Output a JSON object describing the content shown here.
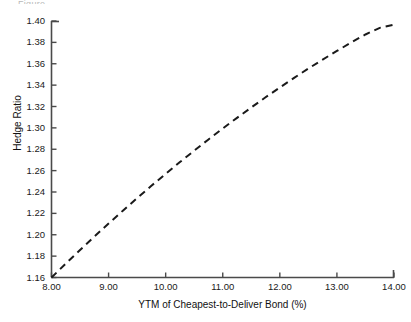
{
  "figure": {
    "cropped_top_text": "Figure"
  },
  "chart_data": {
    "type": "line",
    "title": "",
    "subtitle": "",
    "xlabel": "YTM of Cheapest-to-Deliver Bond (%)",
    "ylabel": "Hedge Ratio",
    "xlim": [
      8.0,
      14.0
    ],
    "ylim": [
      1.16,
      1.4
    ],
    "xticks": [
      8.0,
      9.0,
      10.0,
      11.0,
      12.0,
      13.0,
      14.0
    ],
    "xticklabels": [
      "8.00",
      "9.00",
      "10.00",
      "11.00",
      "12.00",
      "13.00",
      "14.00"
    ],
    "yticks": [
      1.16,
      1.18,
      1.2,
      1.22,
      1.24,
      1.26,
      1.28,
      1.3,
      1.32,
      1.34,
      1.36,
      1.38,
      1.4
    ],
    "yticklabels": [
      "1.16",
      "1.18",
      "1.20",
      "1.22",
      "1.24",
      "1.26",
      "1.28",
      "1.30",
      "1.32",
      "1.34",
      "1.36",
      "1.38",
      "1.40"
    ],
    "grid": false,
    "legend": null,
    "legend_position": "none",
    "annotations": [],
    "series": [
      {
        "name": "Hedge Ratio",
        "style": "dashed",
        "color": "#1a1a1a",
        "x": [
          8.0,
          8.25,
          8.5,
          8.75,
          9.0,
          9.25,
          9.5,
          9.75,
          10.0,
          10.25,
          10.5,
          10.75,
          11.0,
          11.25,
          11.5,
          11.75,
          12.0,
          12.25,
          12.5,
          12.75,
          13.0,
          13.25,
          13.5,
          13.75,
          14.0
        ],
        "values": [
          1.16,
          1.173,
          1.1857,
          1.1982,
          1.2105,
          1.2225,
          1.2343,
          1.2458,
          1.257,
          1.268,
          1.2787,
          1.2892,
          1.2994,
          1.3094,
          1.3191,
          1.3286,
          1.3378,
          1.3468,
          1.3555,
          1.3639,
          1.372,
          1.3799,
          1.3874,
          1.3936,
          1.3965
        ]
      }
    ]
  },
  "axes": {
    "x_axis_name": "x-axis",
    "y_axis_name": "y-axis"
  }
}
